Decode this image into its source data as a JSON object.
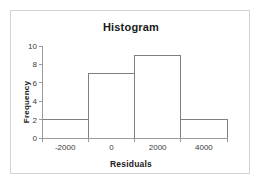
{
  "chart_data": {
    "type": "bar",
    "title": "Histogram",
    "xlabel": "Residuals",
    "ylabel": "Frequency",
    "categories": [
      "-3000 to -1000",
      "-1000 to 1000",
      "1000 to 3000",
      "3000 to 5000"
    ],
    "bin_edges": [
      -3000,
      -1000,
      1000,
      3000,
      5000
    ],
    "values": [
      2,
      7,
      9,
      2
    ],
    "xlim": [
      -3000,
      5000
    ],
    "ylim": [
      0,
      10
    ],
    "x_tick_labels": [
      "-2000",
      "0",
      "2000",
      "4000"
    ],
    "x_tick_values": [
      -2000,
      0,
      2000,
      4000
    ],
    "x_tick_mark_values": [
      -3000,
      -1000,
      1000,
      3000,
      5000
    ],
    "y_tick_labels": [
      "0",
      "2",
      "4",
      "6",
      "8",
      "10"
    ],
    "y_tick_values": [
      0,
      2,
      4,
      6,
      8,
      10
    ],
    "grid": false,
    "legend": null,
    "bar_fill_color": "#ffffff",
    "bar_edge_color": "#808080",
    "axis_color": "#9a9a9a",
    "text_color": "#1a1a1a",
    "frame_color": "#d2d2d2",
    "background_color": "#ffffff"
  }
}
